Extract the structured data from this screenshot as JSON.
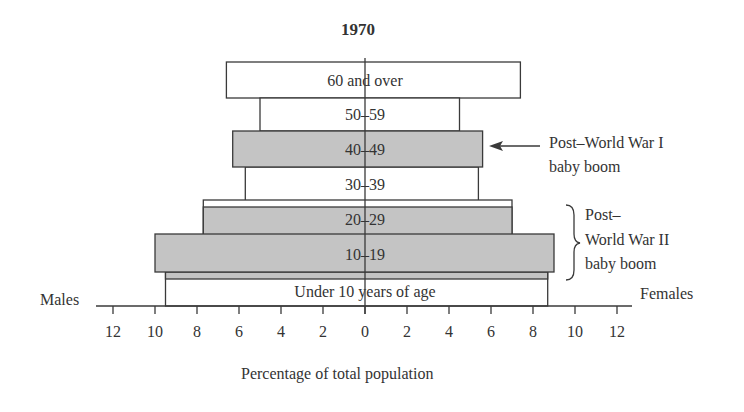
{
  "chart_data": {
    "type": "bar",
    "subtype": "population-pyramid",
    "title": "1970",
    "xlabel": "Percentage of total population",
    "left_label": "Males",
    "right_label": "Females",
    "xlim": [
      -12,
      12
    ],
    "xticks": [
      12,
      10,
      8,
      6,
      4,
      2,
      0,
      2,
      4,
      6,
      8,
      10,
      12
    ],
    "categories": [
      "60 and over",
      "50–59",
      "40–49",
      "30–39",
      "20–29",
      "10–19",
      "Under 10 years of age"
    ],
    "series": [
      {
        "name": "Males",
        "values": [
          6.6,
          5.0,
          6.3,
          5.7,
          7.7,
          10.0,
          9.5
        ]
      },
      {
        "name": "Females",
        "values": [
          7.4,
          4.5,
          5.6,
          5.4,
          7.0,
          9.0,
          8.7
        ]
      }
    ],
    "highlighted": [
      "40–49",
      "20–29",
      "10–19"
    ],
    "annotations": [
      {
        "text": "Post–World War I baby boom",
        "target": "40–49",
        "style": "arrow"
      },
      {
        "text": "Post– World War II baby boom",
        "target": [
          "20–29",
          "10–19"
        ],
        "style": "brace"
      }
    ],
    "grid": false
  },
  "labels": {
    "title": "1970",
    "males": "Males",
    "females": "Females",
    "xlabel": "Percentage of total population",
    "ww1_line1": "Post–World War I",
    "ww1_line2": "baby boom",
    "ww2_line1": "Post–",
    "ww2_line2": "World War II",
    "ww2_line3": "baby boom"
  },
  "colors": {
    "highlight_fill": "#c4c4c4",
    "plain_fill": "#ffffff",
    "stroke": "#3a3a3a",
    "text": "#333333"
  }
}
